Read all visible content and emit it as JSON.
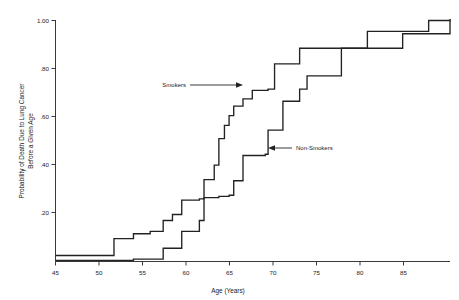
{
  "chart_data": {
    "type": "line",
    "subtype": "step-function empirical cumulative distribution",
    "title": "",
    "xlabel": "Age (Years)",
    "ylabel": "Probability of Death Due to Lung Cancer Before a Given Age",
    "ylabel_lines": [
      "Probability of Death Due to Lung Cancer",
      "Before a Given Age"
    ],
    "xlim": [
      45,
      87.5
    ],
    "ylim": [
      0.0,
      1.02
    ],
    "xticks": [
      45,
      50,
      55,
      60,
      65,
      70,
      75,
      80,
      85
    ],
    "xtick_labels": [
      "45",
      "50",
      "55",
      "60",
      "65",
      "70",
      "75",
      "80",
      "85"
    ],
    "yticks": [
      0.2,
      0.4,
      0.6,
      0.8,
      1.0
    ],
    "ytick_labels": [
      ".20",
      ".40",
      ".60",
      ".80",
      "1.00"
    ],
    "grid": false,
    "legend_position": "inline-annotations",
    "annotations": [
      {
        "text": "Smokers",
        "points_to": "smokers",
        "arrow_direction": "right",
        "x_data": 63.5,
        "y_data": 0.715
      },
      {
        "text": "Non-Smokers",
        "points_to": "non-smokers",
        "arrow_direction": "left",
        "x_data": 73.0,
        "y_data": 0.455
      }
    ],
    "series": [
      {
        "name": "Smokers",
        "step_type": "post",
        "x": [
          45.0,
          51.3,
          53.4,
          55.2,
          56.6,
          57.6,
          58.6,
          60.5,
          61.0,
          62.1,
          62.6,
          63.2,
          63.7,
          64.2,
          65.2,
          66.2,
          67.9,
          68.6,
          71.3,
          75.8,
          78.6,
          82.4,
          85.2,
          87.5
        ],
        "y": [
          0.025,
          0.095,
          0.115,
          0.125,
          0.17,
          0.195,
          0.255,
          0.26,
          0.34,
          0.4,
          0.51,
          0.565,
          0.605,
          0.645,
          0.675,
          0.71,
          0.715,
          0.82,
          0.885,
          0.885,
          0.955,
          0.955,
          1.0,
          1.005
        ]
      },
      {
        "name": "Non-Smokers",
        "step_type": "post",
        "x": [
          45.0,
          53.4,
          56.6,
          57.6,
          58.6,
          60.5,
          61.0,
          62.6,
          63.7,
          64.2,
          65.2,
          67.6,
          67.9,
          69.5,
          71.3,
          72.1,
          75.0,
          75.8,
          78.6,
          82.4,
          85.2,
          87.5
        ],
        "y": [
          0.005,
          0.01,
          0.055,
          0.055,
          0.125,
          0.17,
          0.265,
          0.27,
          0.275,
          0.335,
          0.44,
          0.445,
          0.545,
          0.665,
          0.715,
          0.77,
          0.77,
          0.885,
          0.885,
          0.945,
          0.945,
          1.005
        ]
      }
    ]
  },
  "axis": {
    "x_title": "Age (Years)",
    "y_title_line1": "Probability of Death Due to Lung Cancer",
    "y_title_line2": "Before a Given Age"
  },
  "labels": {
    "smokers": "Smokers",
    "non_smokers": "Non-Smokers"
  },
  "colors": {
    "curve": "#222222",
    "axis": "#3a3a3a",
    "background": "#ffffff",
    "text": "#1a1a1a"
  }
}
